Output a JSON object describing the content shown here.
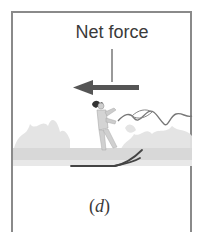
{
  "figure": {
    "label": "Net force",
    "caption_open": "(",
    "caption_letter": "d",
    "caption_close": ")",
    "arrow_direction": "left",
    "colors": {
      "frame": "#8a8a8a",
      "arrow": "#555555",
      "text": "#3a3a3a",
      "spray": "#dcdcdc",
      "water": "#d6d6d6",
      "skis": "#444444"
    }
  }
}
